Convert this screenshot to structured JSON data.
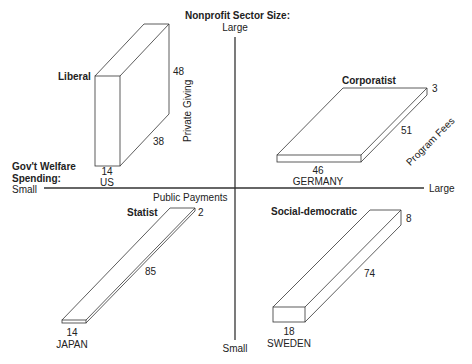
{
  "diagram": {
    "type": "regime-typology-quadrant",
    "axes": {
      "vertical": {
        "title": "Nonprofit Sector Size:",
        "top_label": "Large",
        "bottom_label": "Small",
        "side_label": "Private Giving"
      },
      "horizontal": {
        "title_line1": "Gov't Welfare",
        "title_line2": "Spending:",
        "left_label": "Small",
        "right_label": "Large",
        "side_label": "Public Payments"
      },
      "depth_label": "Program Fees"
    },
    "regimes": [
      {
        "name": "Liberal",
        "country": "US",
        "public_payments": "14",
        "program_fees": "38",
        "private_giving": "48"
      },
      {
        "name": "Corporatist",
        "country": "GERMANY",
        "public_payments": "46",
        "program_fees": "51",
        "private_giving": "3"
      },
      {
        "name": "Statist",
        "country": "JAPAN",
        "public_payments": "14",
        "program_fees": "85",
        "private_giving": "2"
      },
      {
        "name": "Social-democratic",
        "country": "SWEDEN",
        "public_payments": "18",
        "program_fees": "74",
        "private_giving": "8"
      }
    ]
  },
  "colors": {
    "line": "#333333",
    "text": "#222222",
    "background": "#ffffff"
  }
}
